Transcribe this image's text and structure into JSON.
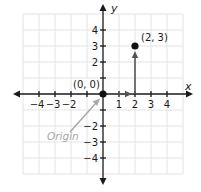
{
  "diagram": {
    "type": "coordinate-plane",
    "axes": {
      "x_label": "x",
      "y_label": "y",
      "x_range": [
        -5,
        5
      ],
      "y_range": [
        -5,
        5
      ]
    },
    "x_ticks": [
      "−4",
      "−3",
      "−2",
      "1",
      "2",
      "3",
      "4"
    ],
    "y_ticks": [
      "4",
      "3",
      "2",
      "−2",
      "−3",
      "−4"
    ],
    "points": [
      {
        "label": "(0, 0)",
        "x": 0,
        "y": 0
      },
      {
        "label": "(2, 3)",
        "x": 2,
        "y": 3
      }
    ],
    "annotation": {
      "text": "Origin",
      "color": "#a8a8a8"
    },
    "colors": {
      "grid": "#e3e3e3",
      "axis": "#1a1a1a",
      "path_arrow": "#555555"
    }
  }
}
